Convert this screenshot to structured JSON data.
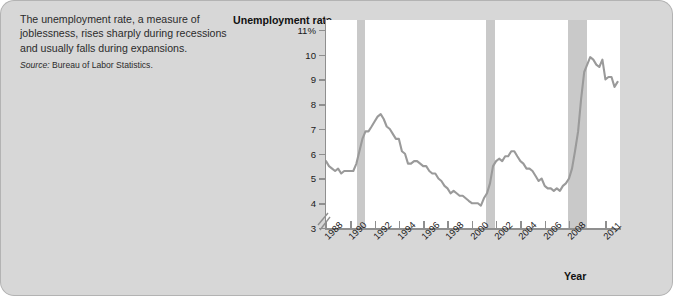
{
  "caption": {
    "body": "The unemployment rate, a measure of joblessness, rises sharply during recessions and usually falls during expansions.",
    "source_label": "Source:",
    "source_text": " Bureau of Labor Statistics."
  },
  "chart_data": {
    "type": "line",
    "title": "",
    "ylabel": "Unemployment rate",
    "xlabel": "Year",
    "ylim": [
      3,
      11.4
    ],
    "xlim": [
      1988,
      2012.2
    ],
    "grid": false,
    "legend": null,
    "y_axis_break": true,
    "y_ticks": [
      3,
      4,
      5,
      6,
      7,
      8,
      9,
      10,
      11
    ],
    "y_tick_labels": [
      "3",
      "4",
      "5",
      "6",
      "7",
      "8",
      "9",
      "10",
      "11%"
    ],
    "x_ticks": [
      1988,
      1990,
      1992,
      1994,
      1996,
      1998,
      2000,
      2002,
      2004,
      2006,
      2008,
      2011
    ],
    "x_tick_labels": [
      "1988",
      "1990",
      "1992",
      "1994",
      "1996",
      "1998",
      "2000",
      "2002",
      "2004",
      "2006",
      "2008",
      "2011"
    ],
    "line_color": "#9a9a9a",
    "recession_band_color": "#c9c9c9",
    "recession_bands": [
      {
        "start": 1990.55,
        "end": 1991.25
      },
      {
        "start": 2001.2,
        "end": 2001.92
      },
      {
        "start": 2007.95,
        "end": 2009.45
      }
    ],
    "series": [
      {
        "name": "Unemployment rate",
        "units": "percent",
        "x": [
          1988.0,
          1988.25,
          1988.5,
          1988.75,
          1989.0,
          1989.25,
          1989.5,
          1989.75,
          1990.0,
          1990.25,
          1990.5,
          1990.75,
          1991.0,
          1991.25,
          1991.5,
          1991.75,
          1992.0,
          1992.25,
          1992.5,
          1992.75,
          1993.0,
          1993.25,
          1993.5,
          1993.75,
          1994.0,
          1994.25,
          1994.5,
          1994.75,
          1995.0,
          1995.25,
          1995.5,
          1995.75,
          1996.0,
          1996.25,
          1996.5,
          1996.75,
          1997.0,
          1997.25,
          1997.5,
          1997.75,
          1998.0,
          1998.25,
          1998.5,
          1998.75,
          1999.0,
          1999.25,
          1999.5,
          1999.75,
          2000.0,
          2000.25,
          2000.5,
          2000.75,
          2001.0,
          2001.25,
          2001.5,
          2001.75,
          2002.0,
          2002.25,
          2002.5,
          2002.75,
          2003.0,
          2003.25,
          2003.5,
          2003.75,
          2004.0,
          2004.25,
          2004.5,
          2004.75,
          2005.0,
          2005.25,
          2005.5,
          2005.75,
          2006.0,
          2006.25,
          2006.5,
          2006.75,
          2007.0,
          2007.25,
          2007.5,
          2007.75,
          2008.0,
          2008.25,
          2008.5,
          2008.75,
          2009.0,
          2009.25,
          2009.5,
          2009.75,
          2010.0,
          2010.25,
          2010.5,
          2010.75,
          2011.0,
          2011.25,
          2011.5,
          2011.75,
          2012.0
        ],
        "y": [
          5.7,
          5.5,
          5.4,
          5.3,
          5.4,
          5.2,
          5.3,
          5.3,
          5.3,
          5.3,
          5.6,
          6.1,
          6.6,
          6.9,
          6.9,
          7.1,
          7.3,
          7.5,
          7.6,
          7.4,
          7.1,
          7.0,
          6.8,
          6.6,
          6.6,
          6.1,
          6.0,
          5.6,
          5.6,
          5.7,
          5.7,
          5.6,
          5.5,
          5.5,
          5.3,
          5.2,
          5.2,
          5.0,
          4.9,
          4.7,
          4.6,
          4.4,
          4.5,
          4.4,
          4.3,
          4.3,
          4.2,
          4.1,
          4.0,
          4.0,
          4.0,
          3.9,
          4.2,
          4.4,
          4.8,
          5.5,
          5.7,
          5.8,
          5.7,
          5.9,
          5.9,
          6.1,
          6.1,
          5.9,
          5.7,
          5.6,
          5.4,
          5.4,
          5.3,
          5.1,
          4.9,
          5.0,
          4.7,
          4.6,
          4.6,
          4.5,
          4.6,
          4.5,
          4.7,
          4.8,
          5.0,
          5.4,
          6.1,
          6.9,
          8.2,
          9.3,
          9.6,
          9.9,
          9.8,
          9.6,
          9.5,
          9.8,
          9.0,
          9.1,
          9.1,
          8.7,
          8.9
        ]
      }
    ]
  }
}
